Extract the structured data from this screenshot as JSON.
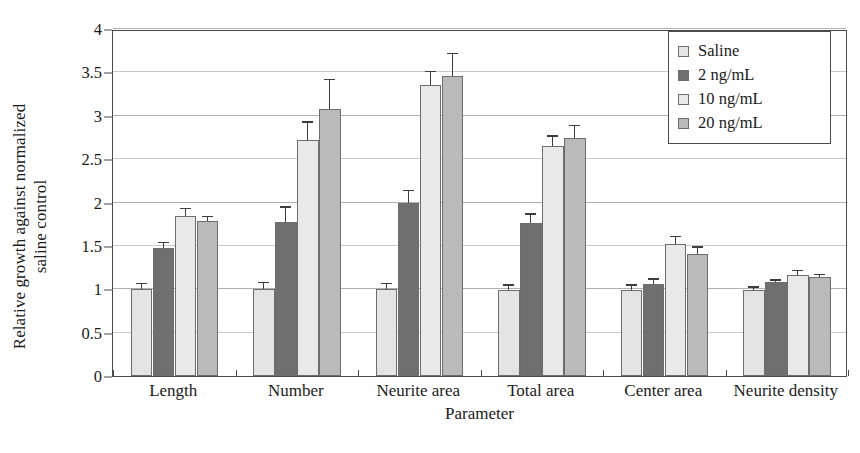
{
  "chart_data": {
    "type": "bar",
    "title": "",
    "xlabel": "Parameter",
    "ylabel": "Relative growth against normalized saline control",
    "ylabel_lines": [
      "Relative growth against normalized",
      "saline control"
    ],
    "categories": [
      "Length",
      "Number",
      "Neurite area",
      "Total area",
      "Center area",
      "Neurite density"
    ],
    "ylim": [
      0,
      4
    ],
    "yticks": [
      0,
      0.5,
      1,
      1.5,
      2,
      2.5,
      3,
      3.5,
      4
    ],
    "ytick_labels": [
      "0",
      "0.5",
      "1",
      "1.5",
      "2",
      "2.5",
      "3",
      "3.5",
      "4"
    ],
    "grid": true,
    "grid_axis": "y",
    "legend_position": "top-right",
    "series": [
      {
        "name": "Saline",
        "color": "#e4e4e4",
        "values": [
          1.0,
          1.0,
          1.0,
          0.99,
          0.99,
          0.99
        ],
        "errors": [
          0.06,
          0.07,
          0.06,
          0.05,
          0.05,
          0.03
        ]
      },
      {
        "name": "2 ng/mL",
        "color": "#6f6f6f",
        "values": [
          1.47,
          1.78,
          2.0,
          1.76,
          1.06,
          1.08
        ],
        "errors": [
          0.06,
          0.16,
          0.13,
          0.1,
          0.05,
          0.02
        ]
      },
      {
        "name": "10 ng/mL",
        "color": "#e9e9e9",
        "values": [
          1.85,
          2.72,
          3.36,
          2.65,
          1.52,
          1.17
        ],
        "errors": [
          0.07,
          0.2,
          0.14,
          0.11,
          0.08,
          0.04
        ]
      },
      {
        "name": "20 ng/mL",
        "color": "#bababa",
        "values": [
          1.79,
          3.08,
          3.46,
          2.74,
          1.41,
          1.14
        ],
        "errors": [
          0.04,
          0.33,
          0.25,
          0.14,
          0.07,
          0.02
        ]
      }
    ]
  },
  "legend": {
    "items": [
      {
        "label": "Saline",
        "swatch": "#e4e4e4"
      },
      {
        "label": "2 ng/mL",
        "swatch": "#6f6f6f"
      },
      {
        "label": "10 ng/mL",
        "swatch": "#e9e9e9"
      },
      {
        "label": "20 ng/mL",
        "swatch": "#bababa"
      }
    ]
  },
  "axes": {
    "x_title": "Parameter",
    "y_title_line1": "Relative growth against normalized",
    "y_title_line2": "saline control"
  }
}
